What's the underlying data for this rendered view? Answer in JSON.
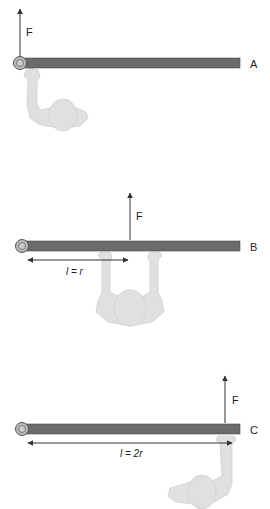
{
  "colors": {
    "rod": "#6b6b6b",
    "rod_edge": "#4a4a4a",
    "pivot_ring": "#888888",
    "person": "#e0e0e0",
    "person_edge": "#c8c8c8",
    "arrow": "#333333"
  },
  "panels": [
    {
      "id": "A",
      "label": "A",
      "force_label": "F",
      "lever_label": ""
    },
    {
      "id": "B",
      "label": "B",
      "force_label": "F",
      "lever_label": "l = r"
    },
    {
      "id": "C",
      "label": "C",
      "force_label": "F",
      "lever_label": "l = 2r"
    }
  ]
}
